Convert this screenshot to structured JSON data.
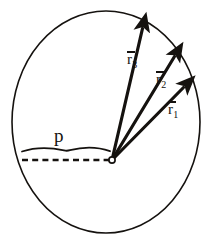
{
  "figure": {
    "type": "vector-diagram",
    "background_color": "#ffffff",
    "ink_color": "#15120f",
    "circle": {
      "name": "boundary-circle",
      "center_x": 106,
      "center_y": 122,
      "radius_x": 94,
      "radius_y": 111,
      "stroke_width": 1.6
    },
    "origin_point": {
      "name": "vertex-origin",
      "x": 112,
      "y": 160,
      "radius": 3.2,
      "filled": false
    },
    "vectors": [
      {
        "id": "r1",
        "label": "r",
        "subscript": "1",
        "overbar": true,
        "start_x": 112,
        "start_y": 160,
        "tip_x": 190,
        "tip_y": 81,
        "label_x": 168,
        "label_y": 101,
        "angle_deg": 45.4
      },
      {
        "id": "r2",
        "label": "r",
        "subscript": "2",
        "overbar": true,
        "start_x": 112,
        "start_y": 160,
        "tip_x": 180,
        "tip_y": 47,
        "label_x": 156,
        "label_y": 71,
        "angle_deg": 58.9
      },
      {
        "id": "r3",
        "label": "r",
        "subscript": "3",
        "overbar": true,
        "start_x": 112,
        "start_y": 160,
        "tip_x": 145,
        "tip_y": 17,
        "label_x": 127,
        "label_y": 51,
        "angle_deg": 77.0
      }
    ],
    "impact_parameter": {
      "name": "impact-parameter-p",
      "label": "p",
      "label_x": 54,
      "label_y": 126,
      "dashed_line": {
        "x_start": 22,
        "x_end": 110,
        "y": 160,
        "dash_length": 6,
        "gap_length": 4,
        "stroke_width": 2.2
      },
      "brace": {
        "x_start": 22,
        "x_end": 110,
        "y": 150,
        "stroke_width": 1.8
      }
    }
  }
}
